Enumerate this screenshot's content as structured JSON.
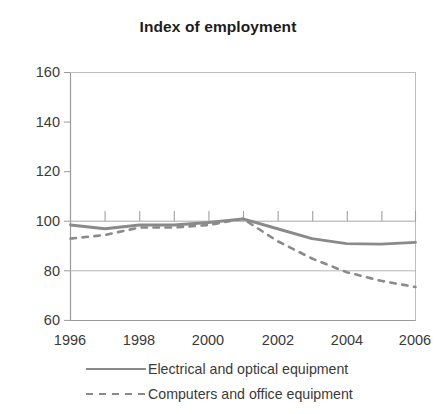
{
  "chart_data": {
    "type": "line",
    "title": "Index of employment",
    "subtitle": "",
    "xlabel": "",
    "ylabel": "",
    "xlim": [
      1996,
      2006
    ],
    "ylim": [
      60,
      160
    ],
    "yticks": [
      60,
      80,
      100,
      120,
      140,
      160
    ],
    "ytick_labels": [
      "60",
      "80",
      "100",
      "120",
      "140",
      "160"
    ],
    "xticks": [
      1996,
      1998,
      2000,
      2002,
      2004,
      2006
    ],
    "xtick_labels": [
      "1996",
      "1998",
      "2000",
      "2002",
      "2004",
      "2006"
    ],
    "x_minor_ticks": [
      1996,
      1997,
      1998,
      1999,
      2000,
      2001,
      2002,
      2003,
      2004,
      2005,
      2006
    ],
    "grid": "horizontal-at-y-100-and-80",
    "legend_position": "below",
    "x": [
      1996,
      1997,
      1998,
      1999,
      2000,
      2001,
      2002,
      2003,
      2004,
      2005,
      2006
    ],
    "series": [
      {
        "name": "Electrical and optical equipment",
        "style": "solid",
        "color": "#8a8a8a",
        "values": [
          98.5,
          97.0,
          98.5,
          98.5,
          99.5,
          101.0,
          97.0,
          93.0,
          91.0,
          90.8,
          91.5
        ]
      },
      {
        "name": "Computers and office equipment",
        "style": "dashed",
        "color": "#8a8a8a",
        "values": [
          93.0,
          94.5,
          97.5,
          97.5,
          98.5,
          101.0,
          92.0,
          85.0,
          79.5,
          76.0,
          73.5
        ]
      }
    ]
  },
  "title": "Index of employment",
  "axes": {
    "ytick_labels": [
      "160",
      "140",
      "120",
      "100",
      "80",
      "60"
    ],
    "xtick_labels": [
      "1996",
      "1998",
      "2000",
      "2002",
      "2004",
      "2006"
    ]
  },
  "legend": {
    "items": [
      {
        "label": "Electrical and optical equipment",
        "style": "solid"
      },
      {
        "label": "Computers and office equipment",
        "style": "dashed"
      }
    ]
  },
  "colors": {
    "line": "#8a8a8a",
    "axis": "#8f8f8f",
    "text": "#3a3a3a",
    "title": "#1d1d1d",
    "background": "#ffffff"
  }
}
